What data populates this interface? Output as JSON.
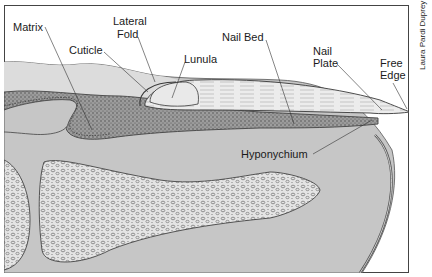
{
  "credit": "Laura Pardi Duprey",
  "labels": {
    "matrix": "Matrix",
    "lateral_fold_1": "Lateral",
    "lateral_fold_2": "Fold",
    "cuticle": "Cuticle",
    "lunula": "Lunula",
    "nail_bed": "Nail Bed",
    "nail_plate_1": "Nail",
    "nail_plate_2": "Plate",
    "free_edge_1": "Free",
    "free_edge_2": "Edge",
    "hyponychium": "Hyponychium"
  },
  "colors": {
    "skin": "#c8c8c8",
    "fold_skin": "#dcdcdc",
    "stipple_tissue": "#8a8a8a",
    "nail_plate": "#e6e6e6",
    "bone": "#e8e8e8",
    "outline": "#3a3a3a",
    "border": "#444444"
  }
}
